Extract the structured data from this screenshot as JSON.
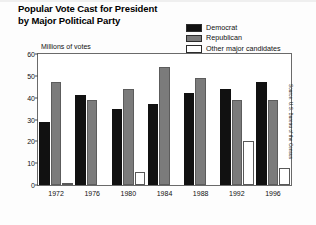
{
  "title": {
    "line1": "Popular Vote Cast for President",
    "line2": "by Major Political Party"
  },
  "axis": {
    "y_label": "Millions of votes"
  },
  "source": "Source: U.S. Bureau of the Census",
  "legend": [
    {
      "label": "Democrat",
      "color": "#111111"
    },
    {
      "label": "Republican",
      "color": "#7b7b7b"
    },
    {
      "label": "Other major candidates",
      "color": "#ffffff"
    }
  ],
  "chart_data": {
    "type": "bar",
    "title": "Popular Vote Cast for President by Major Political Party",
    "xlabel": "",
    "ylabel": "Millions of votes",
    "ylim": [
      0,
      60
    ],
    "yticks": [
      0,
      10,
      20,
      30,
      40,
      50,
      60
    ],
    "grid": false,
    "legend_position": "top-right",
    "categories": [
      "1972",
      "1976",
      "1980",
      "1984",
      "1988",
      "1992",
      "1996"
    ],
    "series": [
      {
        "name": "Democrat",
        "color": "#111111",
        "values": [
          29,
          41,
          35,
          37,
          42,
          44,
          47
        ]
      },
      {
        "name": "Republican",
        "color": "#7b7b7b",
        "values": [
          47,
          39,
          44,
          54,
          49,
          39,
          39
        ]
      },
      {
        "name": "Other major candidates",
        "color": "#ffffff",
        "values": [
          1,
          0,
          6,
          0,
          0,
          20,
          8
        ]
      }
    ]
  }
}
